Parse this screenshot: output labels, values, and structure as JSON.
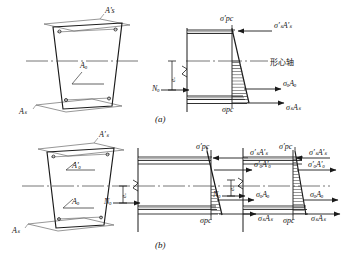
{
  "figure": {
    "title_absent": true,
    "captions": [
      {
        "id": "a",
        "text": "(a)"
      },
      {
        "id": "b",
        "text": "(b)"
      }
    ],
    "axis_note": "形心轴"
  },
  "panel_a": {
    "section_labels": {
      "top_steel": "A's",
      "tendon": "Aₒ",
      "bottom_steel": "Aₛ"
    },
    "stress_labels": {
      "top_concrete": "σ'pc",
      "top_steel_force": "σ'ₛA'ₛ",
      "tendon_force": "σₒAₒ",
      "bottom_steel_force": "σₛAₛ",
      "bottom_concrete": "σpc"
    },
    "force_labels": {
      "prestress_resultant": "Nₒ",
      "eccentricity": "eₒ"
    }
  },
  "panel_b": {
    "section_labels": {
      "top_steel": "A'ₛ",
      "top_tendon": "A'ₒ",
      "bottom_tendon": "Aₒ",
      "bottom_steel": "Aₛ"
    },
    "middle_diagram": {
      "top_concrete": "σ'pc",
      "top_steel_force": "σ'ₛA'ₛ",
      "top_tendon_force": "σ'ₒA'ₒ",
      "tendon_force": "σₒAₒ",
      "bottom_steel_force": "σₛAₛ",
      "bottom_concrete": "σpc",
      "prestress_resultant": "Nₒ",
      "eccentricity": "eₒ"
    },
    "right_diagram": {
      "top_concrete": "σ'pc",
      "top_steel_force": "σ'ₛA'ₛ",
      "top_tendon_force": "σ'ₒA'ₒ",
      "tendon_force": "σₒAₒ",
      "bottom_steel_force": "σₛAₛ",
      "bottom_concrete": "σpc",
      "prestress_resultant": "Nₒ",
      "eccentricity": "eₒ"
    }
  },
  "colors": {
    "line": "#1a1a1a",
    "thin": "#555555",
    "hatch": "#3a3a3a",
    "axis": "#4a4a4a"
  }
}
